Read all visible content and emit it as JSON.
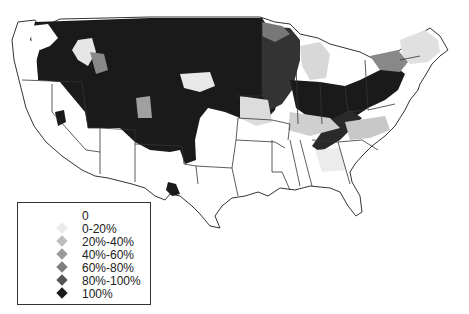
{
  "map": {
    "type": "choropleth",
    "region": "Contiguous United States (county level)",
    "colors": {
      "background": "#ffffff",
      "border": "#333333",
      "bin_0": "#ffffff",
      "bin_0_20": "#e6e6e6",
      "bin_20_40": "#bdbdbd",
      "bin_40_60": "#969696",
      "bin_60_80": "#7a7a7a",
      "bin_80_100": "#555555",
      "bin_100": "#1a1a1a"
    }
  },
  "legend": {
    "items": [
      {
        "label": "0",
        "color": "#ffffff"
      },
      {
        "label": "0-20%",
        "color": "#ebebeb"
      },
      {
        "label": "20%-40%",
        "color": "#bdbdbd"
      },
      {
        "label": "40%-60%",
        "color": "#999999"
      },
      {
        "label": "60%-80%",
        "color": "#7d7d7d"
      },
      {
        "label": "80%-100%",
        "color": "#555555"
      },
      {
        "label": "100%",
        "color": "#1a1a1a"
      }
    ]
  }
}
